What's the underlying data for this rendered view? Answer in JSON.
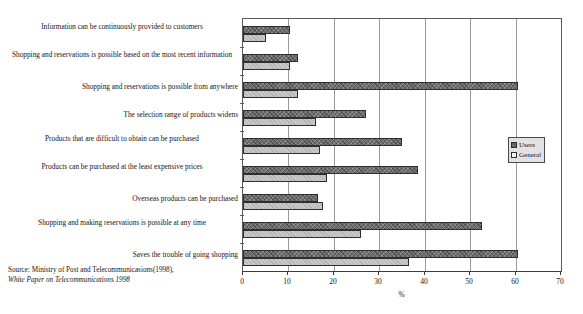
{
  "chart_data": {
    "type": "bar",
    "orientation": "horizontal",
    "title": "",
    "xlabel": "%",
    "ylabel": "",
    "xlim": [
      0,
      70
    ],
    "xticks": [
      0,
      10,
      20,
      30,
      40,
      50,
      60,
      70
    ],
    "grid": true,
    "legend_position": "right",
    "categories": [
      "Information can be continuously provided to customers",
      "Shopping and reservations is possible based on the most recent information",
      "Shopping and reservations is possible from anywhere",
      "The selection range of products widens",
      "Products that are difficult to obtain can be purchased",
      "Products can be purchased at the least expensive prices",
      "Overseas products can be purchased",
      "Shopping and making reservations is possible at any time",
      "Saves the trouble of going shopping"
    ],
    "series": [
      {
        "name": "Users",
        "values": [
          10.3,
          12.0,
          60.5,
          27.0,
          35.0,
          38.5,
          16.5,
          52.5,
          60.5
        ]
      },
      {
        "name": "General",
        "values": [
          5.0,
          10.3,
          12.0,
          16.0,
          17.0,
          18.5,
          17.5,
          26.0,
          36.5
        ]
      }
    ]
  },
  "source": {
    "line1": "Source: Ministry of Post and Telecommunicasions(1998),",
    "line2": "White Paper on Telecommunications 1998"
  },
  "legend": {
    "items": [
      {
        "label": "Users",
        "color": "#6e6e6e"
      },
      {
        "label": "General",
        "color": "#f2f2f2"
      }
    ]
  },
  "axis": {
    "x_title": "%",
    "tick_labels": [
      "0",
      "10",
      "20",
      "30",
      "40",
      "50",
      "60",
      "70"
    ]
  }
}
